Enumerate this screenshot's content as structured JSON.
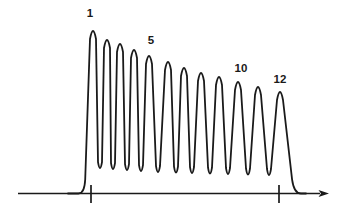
{
  "colors": {
    "ink": "#1a1a1a",
    "background": "#ffffff"
  },
  "chart_data": {
    "type": "line",
    "title": "",
    "xlabel": "",
    "ylabel": "",
    "peak_count": 12,
    "peak_labels": [
      {
        "text": "1",
        "x": 90,
        "y": 17
      },
      {
        "text": "5",
        "x": 151,
        "y": 44
      },
      {
        "text": "10",
        "x": 241,
        "y": 72
      },
      {
        "text": "12",
        "x": 280,
        "y": 83
      }
    ],
    "relative_peak_heights": [
      1.0,
      0.94,
      0.92,
      0.88,
      0.85,
      0.81,
      0.77,
      0.74,
      0.72,
      0.69,
      0.66,
      0.62
    ],
    "baseline_y": 193.5,
    "curve": {
      "start_x": 68,
      "rise_foot_x": 84.5,
      "fall_foot_x": 294,
      "end_x": 306,
      "peaks": [
        {
          "n": 1,
          "x": 93,
          "y": 31
        },
        {
          "n": 2,
          "x": 107,
          "y": 40
        },
        {
          "n": 3,
          "x": 120,
          "y": 44
        },
        {
          "n": 4,
          "x": 134,
          "y": 50
        },
        {
          "n": 5,
          "x": 149,
          "y": 56
        },
        {
          "n": 6,
          "x": 168,
          "y": 62
        },
        {
          "n": 7,
          "x": 184,
          "y": 68
        },
        {
          "n": 8,
          "x": 201,
          "y": 73
        },
        {
          "n": 9,
          "x": 219,
          "y": 77
        },
        {
          "n": 10,
          "x": 238,
          "y": 82
        },
        {
          "n": 11,
          "x": 258,
          "y": 87
        },
        {
          "n": 12,
          "x": 280,
          "y": 92
        }
      ],
      "valleys": [
        {
          "x": 100,
          "y": 168
        },
        {
          "x": 113,
          "y": 169
        },
        {
          "x": 127,
          "y": 170
        },
        {
          "x": 141,
          "y": 171
        },
        {
          "x": 158,
          "y": 172
        },
        {
          "x": 176,
          "y": 172.5
        },
        {
          "x": 192,
          "y": 173
        },
        {
          "x": 210,
          "y": 173.5
        },
        {
          "x": 228,
          "y": 174
        },
        {
          "x": 248,
          "y": 174.5
        },
        {
          "x": 269,
          "y": 175
        }
      ]
    },
    "axis": {
      "x1": 18,
      "x2": 320,
      "arrow_tip_x": 329,
      "tick_xs": [
        91,
        279
      ],
      "tick_top_y": 185,
      "tick_bottom_y": 203
    }
  }
}
